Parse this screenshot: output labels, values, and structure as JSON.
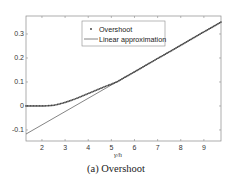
{
  "chart_data": {
    "type": "line",
    "title": "",
    "caption": "(a) Overshoot",
    "xlabel": "γ/h",
    "ylabel": "",
    "xlim": [
      1.31,
      9.74
    ],
    "ylim": [
      -0.146,
      0.375
    ],
    "xticks": [
      2,
      3,
      4,
      5,
      6,
      7,
      8,
      9
    ],
    "yticks": [
      -0.1,
      0,
      0.1,
      0.2,
      0.3
    ],
    "ytick_labels": [
      "-0.1",
      "0",
      "0.1",
      "0.2",
      "0.3"
    ],
    "grid": false,
    "legend_position": "upper center",
    "series": [
      {
        "name": "Overshoot",
        "style": "dots",
        "color": "#444444",
        "x": [
          1.31,
          1.5,
          1.75,
          2.0,
          2.25,
          2.5,
          2.75,
          3.0,
          3.25,
          3.5,
          3.75,
          4.0,
          4.25,
          4.5,
          4.75,
          5.0,
          5.25,
          5.5,
          6.0,
          6.5,
          7.0,
          7.5,
          8.0,
          8.5,
          9.0,
          9.5,
          9.74
        ],
        "values": [
          0.0,
          0.0,
          0.0,
          0.0,
          0.001,
          0.003,
          0.008,
          0.015,
          0.023,
          0.032,
          0.042,
          0.052,
          0.062,
          0.072,
          0.082,
          0.091,
          0.101,
          0.115,
          0.142,
          0.17,
          0.198,
          0.225,
          0.253,
          0.281,
          0.309,
          0.336,
          0.35
        ]
      },
      {
        "name": "Linear approximation",
        "style": "line",
        "color": "#666666",
        "x": [
          1.31,
          9.74
        ],
        "values": [
          -0.117,
          0.35
        ]
      }
    ]
  }
}
